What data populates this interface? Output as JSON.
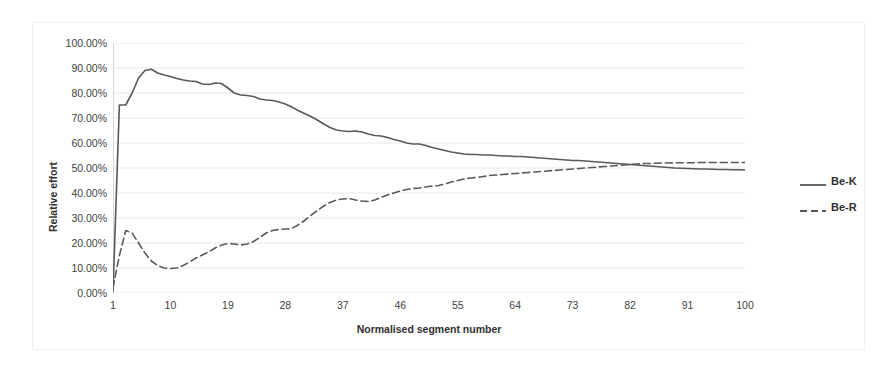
{
  "chart_data": {
    "type": "line",
    "title": "",
    "xlabel": "Normalised segment number",
    "ylabel": "Relative effort",
    "xlim": [
      1,
      100
    ],
    "ylim": [
      0,
      1
    ],
    "grid": true,
    "y_tick_labels": [
      "100.00%",
      "90.00%",
      "80.00%",
      "70.00%",
      "60.00%",
      "50.00%",
      "40.00%",
      "30.00%",
      "20.00%",
      "10.00%",
      "0.00%"
    ],
    "y_tick_values": [
      1.0,
      0.9,
      0.8,
      0.7,
      0.6,
      0.5,
      0.4,
      0.3,
      0.2,
      0.1,
      0.0
    ],
    "x_tick_labels": [
      "1",
      "10",
      "19",
      "28",
      "37",
      "46",
      "55",
      "64",
      "73",
      "82",
      "91",
      "100"
    ],
    "x_tick_values": [
      1,
      10,
      19,
      28,
      37,
      46,
      55,
      64,
      73,
      82,
      91,
      100
    ],
    "legend_position": "right",
    "line_color": "#595959",
    "grid_color": "#e8e8e8",
    "series": [
      {
        "name": "Be-K",
        "style": "solid",
        "color": "#595959",
        "x": [
          1,
          2,
          3,
          4,
          5,
          6,
          7,
          8,
          9,
          10,
          11,
          12,
          13,
          14,
          15,
          16,
          17,
          18,
          19,
          20,
          21,
          22,
          23,
          24,
          25,
          26,
          27,
          28,
          29,
          30,
          31,
          32,
          33,
          34,
          35,
          36,
          37,
          38,
          39,
          40,
          41,
          42,
          43,
          44,
          45,
          46,
          47,
          48,
          49,
          50,
          51,
          52,
          53,
          54,
          55,
          56,
          57,
          58,
          59,
          60,
          61,
          62,
          63,
          64,
          65,
          66,
          67,
          68,
          69,
          70,
          71,
          72,
          73,
          74,
          75,
          76,
          77,
          78,
          79,
          80,
          81,
          82,
          83,
          84,
          85,
          86,
          87,
          88,
          89,
          90,
          91,
          92,
          93,
          94,
          95,
          96,
          97,
          98,
          99,
          100
        ],
        "values": [
          0.005,
          0.752,
          0.752,
          0.8,
          0.86,
          0.89,
          0.895,
          0.88,
          0.872,
          0.866,
          0.858,
          0.852,
          0.848,
          0.846,
          0.836,
          0.834,
          0.84,
          0.838,
          0.82,
          0.8,
          0.792,
          0.79,
          0.786,
          0.776,
          0.772,
          0.77,
          0.764,
          0.756,
          0.744,
          0.73,
          0.718,
          0.706,
          0.692,
          0.676,
          0.662,
          0.652,
          0.648,
          0.646,
          0.648,
          0.644,
          0.636,
          0.63,
          0.628,
          0.622,
          0.614,
          0.608,
          0.6,
          0.596,
          0.596,
          0.59,
          0.582,
          0.576,
          0.57,
          0.564,
          0.56,
          0.556,
          0.554,
          0.554,
          0.552,
          0.552,
          0.55,
          0.548,
          0.548,
          0.546,
          0.546,
          0.544,
          0.542,
          0.54,
          0.538,
          0.536,
          0.534,
          0.532,
          0.53,
          0.53,
          0.528,
          0.526,
          0.524,
          0.522,
          0.52,
          0.518,
          0.516,
          0.514,
          0.512,
          0.51,
          0.508,
          0.506,
          0.504,
          0.502,
          0.5,
          0.499,
          0.498,
          0.497,
          0.496,
          0.496,
          0.495,
          0.494,
          0.494,
          0.493,
          0.493,
          0.492
        ]
      },
      {
        "name": "Be-R",
        "style": "dashed",
        "color": "#595959",
        "x": [
          1,
          2,
          3,
          4,
          5,
          6,
          7,
          8,
          9,
          10,
          11,
          12,
          13,
          14,
          15,
          16,
          17,
          18,
          19,
          20,
          21,
          22,
          23,
          24,
          25,
          26,
          27,
          28,
          29,
          30,
          31,
          32,
          33,
          34,
          35,
          36,
          37,
          38,
          39,
          40,
          41,
          42,
          43,
          44,
          45,
          46,
          47,
          48,
          49,
          50,
          51,
          52,
          53,
          54,
          55,
          56,
          57,
          58,
          59,
          60,
          61,
          62,
          63,
          64,
          65,
          66,
          67,
          68,
          69,
          70,
          71,
          72,
          73,
          74,
          75,
          76,
          77,
          78,
          79,
          80,
          81,
          82,
          83,
          84,
          85,
          86,
          87,
          88,
          89,
          90,
          91,
          92,
          93,
          94,
          95,
          96,
          97,
          98,
          99,
          100
        ],
        "values": [
          0.02,
          0.15,
          0.25,
          0.24,
          0.2,
          0.16,
          0.128,
          0.11,
          0.1,
          0.098,
          0.1,
          0.11,
          0.124,
          0.14,
          0.152,
          0.164,
          0.18,
          0.192,
          0.198,
          0.196,
          0.192,
          0.196,
          0.206,
          0.222,
          0.24,
          0.25,
          0.254,
          0.256,
          0.258,
          0.272,
          0.29,
          0.31,
          0.33,
          0.348,
          0.362,
          0.372,
          0.376,
          0.378,
          0.372,
          0.368,
          0.366,
          0.372,
          0.382,
          0.392,
          0.4,
          0.408,
          0.414,
          0.418,
          0.42,
          0.424,
          0.428,
          0.43,
          0.436,
          0.444,
          0.45,
          0.456,
          0.46,
          0.462,
          0.466,
          0.47,
          0.472,
          0.474,
          0.476,
          0.478,
          0.48,
          0.482,
          0.484,
          0.486,
          0.488,
          0.49,
          0.492,
          0.494,
          0.496,
          0.498,
          0.5,
          0.502,
          0.504,
          0.506,
          0.508,
          0.51,
          0.512,
          0.514,
          0.516,
          0.518,
          0.518,
          0.519,
          0.52,
          0.52,
          0.521,
          0.521,
          0.521,
          0.521,
          0.522,
          0.522,
          0.522,
          0.522,
          0.522,
          0.522,
          0.522,
          0.522
        ]
      }
    ]
  },
  "legend": {
    "items": [
      {
        "label": "Be-K",
        "style": "solid"
      },
      {
        "label": "Be-R",
        "style": "dashed"
      }
    ]
  }
}
